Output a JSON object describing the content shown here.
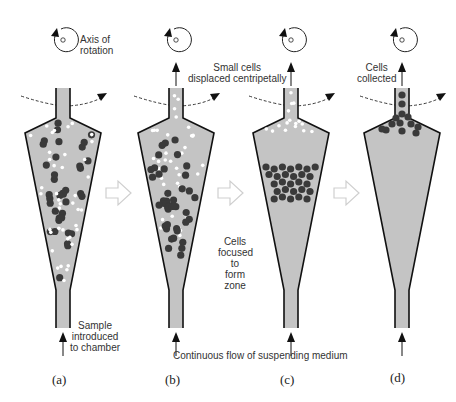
{
  "figure": {
    "labels": {
      "axis_of_rotation": [
        "Axis of",
        "rotation"
      ],
      "small_cells_displaced": [
        "Small cells",
        "displaced centripetally"
      ],
      "cells_collected": [
        "Cells",
        "collected"
      ],
      "sample_introduced": [
        "Sample",
        "introduced",
        "to chamber"
      ],
      "cells_focused": [
        "Cells",
        "focused",
        "to",
        "form",
        "zone"
      ],
      "continuous_flow": "Continuous flow of suspending medium"
    },
    "panels": [
      {
        "id": "a",
        "caption": "(a)",
        "cx": 63,
        "state": "mixed cells distributed throughout chamber"
      },
      {
        "id": "b",
        "caption": "(b)",
        "cx": 176,
        "state": "small cells moving toward top, large cells lower"
      },
      {
        "id": "c",
        "caption": "(c)",
        "cx": 291,
        "state": "small cells exiting, large cells focused in a zone"
      },
      {
        "id": "d",
        "caption": "(d)",
        "cx": 402,
        "state": "large cells collected at top"
      }
    ],
    "colors": {
      "chamber_fill": "#c4c4c4",
      "outline": "#111111",
      "large_cell": "#3a3a3a",
      "small_cell": "#ffffff",
      "transition_arrow": "#d0d0d0"
    }
  }
}
